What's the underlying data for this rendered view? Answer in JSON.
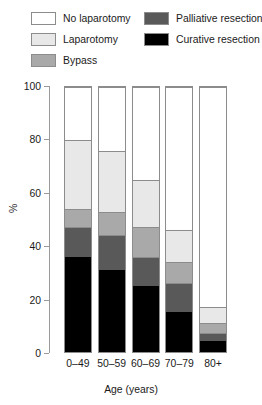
{
  "chart_data": {
    "type": "bar",
    "subtype": "stacked-bar-100",
    "title": "",
    "xlabel": "Age (years)",
    "ylabel": "%",
    "categories": [
      "0–49",
      "50–59",
      "60–69",
      "70–79",
      "80+"
    ],
    "ylim": [
      0,
      100
    ],
    "yticks": [
      0,
      20,
      40,
      60,
      80,
      100
    ],
    "ytick_labels": [
      "0",
      "20",
      "40",
      "60",
      "80",
      "100"
    ],
    "grid": false,
    "legend_position": "top",
    "stack_order_bottom_to_top": [
      "Curative resection",
      "Palliative resection",
      "Bypass",
      "Laparotomy",
      "No laparotomy"
    ],
    "series": [
      {
        "name": "Curative resection",
        "color": "#000000",
        "values": [
          36,
          31,
          25,
          15,
          4
        ]
      },
      {
        "name": "Palliative resection",
        "color": "#595959",
        "values": [
          11,
          13,
          11,
          11,
          3
        ]
      },
      {
        "name": "Bypass",
        "color": "#a9a9a9",
        "values": [
          7,
          9,
          11,
          8,
          4
        ]
      },
      {
        "name": "Laparotomy",
        "color": "#e8e8e8",
        "values": [
          26,
          23,
          18,
          12,
          6
        ]
      },
      {
        "name": "No laparotomy",
        "color": "#ffffff",
        "values": [
          20,
          24,
          35,
          54,
          83
        ]
      }
    ],
    "cumulative_tops": {
      "0–49": [
        36,
        47,
        54,
        80,
        100
      ],
      "50–59": [
        31,
        44,
        53,
        76,
        100
      ],
      "60–69": [
        25,
        36,
        47,
        65,
        100
      ],
      "70–79": [
        15,
        26,
        34,
        46,
        100
      ],
      "80+": [
        4,
        7,
        11,
        17,
        100
      ]
    }
  },
  "legend": {
    "entries": [
      {
        "label": "No laparotomy",
        "color": "#ffffff",
        "swatch_name": "legend-swatch-no-laparotomy"
      },
      {
        "label": "Laparotomy",
        "color": "#e8e8e8",
        "swatch_name": "legend-swatch-laparotomy"
      },
      {
        "label": "Bypass",
        "color": "#a9a9a9",
        "swatch_name": "legend-swatch-bypass"
      },
      {
        "label": "Palliative resection",
        "color": "#595959",
        "swatch_name": "legend-swatch-palliative-resection"
      },
      {
        "label": "Curative resection",
        "color": "#000000",
        "swatch_name": "legend-swatch-curative-resection"
      }
    ]
  },
  "axes": {
    "y_label": "%",
    "x_label": "Age (years)",
    "y_ticks": [
      "100",
      "80",
      "60",
      "40",
      "20",
      "0"
    ],
    "x_ticks": [
      "0–49",
      "50–59",
      "60–69",
      "70–79",
      "80+"
    ]
  },
  "colors": {
    "axis": "#9a9a9a",
    "bar_border": "#8c8c8c",
    "text": "#1a1a1a",
    "background": "#ffffff"
  }
}
